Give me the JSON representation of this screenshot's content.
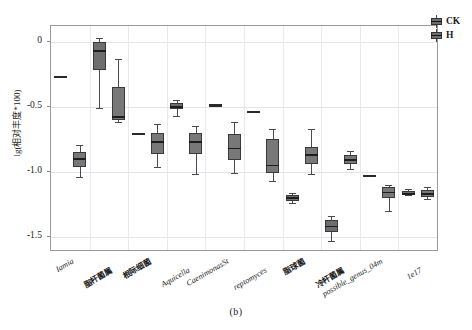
{
  "figure": {
    "caption": "(b)",
    "ylabel": "lg(相对丰度*100)"
  },
  "legend": {
    "position": "top-right",
    "items": [
      {
        "label": "CK",
        "color": "#6e6e6e",
        "key_icon": "boxplot-key-icon"
      },
      {
        "label": "H",
        "color": "#787878",
        "key_icon": "boxplot-key-icon"
      }
    ]
  },
  "yaxis": {
    "ticks": [
      "0",
      "-0.5",
      "-1.0",
      "-1.5"
    ],
    "values": [
      0,
      -0.5,
      -1.0,
      -1.5
    ],
    "min": -1.6,
    "max": 0.12
  },
  "xaxis": {
    "categories": [
      {
        "label": "Iamia",
        "style": "italic"
      },
      {
        "label": "脂杆菌属",
        "style": "cjk"
      },
      {
        "label": "根际细菌",
        "style": "cjk"
      },
      {
        "label": "Aquicella",
        "style": "italic"
      },
      {
        "label": "CaenimonasSt",
        "style": "italic"
      },
      {
        "label": "reptomyces",
        "style": "italic"
      },
      {
        "label": "脂球菌",
        "style": "cjk"
      },
      {
        "label": "冷杆菌属",
        "style": "cjk"
      },
      {
        "label": "possible_genus_04m",
        "style": "italic"
      },
      {
        "label": "1e17",
        "style": "italic"
      }
    ]
  },
  "chart_data": {
    "type": "box",
    "title": "",
    "xlabel": "",
    "ylabel": "lg(相对丰度*100)",
    "ylim": [
      -1.6,
      0.12
    ],
    "grid": true,
    "legend_position": "top-right",
    "categories": [
      "Iamia",
      "脂杆菌属",
      "根际细菌",
      "Aquicella",
      "CaenimonasSt",
      "reptomyces",
      "脂球菌",
      "冷杆菌属",
      "possible_genus_04m",
      "1e17"
    ],
    "series": [
      {
        "name": "CK",
        "color": "#6e6e6e",
        "boxes": [
          {
            "category": "Iamia",
            "min": -0.27,
            "q1": -0.27,
            "median": -0.27,
            "q3": -0.27,
            "max": -0.27,
            "degenerate": true
          },
          {
            "category": "脂杆菌属",
            "min": -0.51,
            "q1": -0.22,
            "median": -0.07,
            "q3": 0.0,
            "max": 0.03,
            "degenerate": false
          },
          {
            "category": "根际细菌",
            "min": -0.72,
            "q1": -0.72,
            "median": -0.71,
            "q3": -0.7,
            "max": -0.7,
            "degenerate": true
          },
          {
            "category": "Aquicella",
            "min": -0.57,
            "q1": -0.52,
            "median": -0.5,
            "q3": -0.47,
            "max": -0.45,
            "degenerate": false
          },
          {
            "category": "CaenimonasSt",
            "min": -0.49,
            "q1": -0.49,
            "median": -0.49,
            "q3": -0.48,
            "max": -0.48,
            "degenerate": true
          },
          {
            "category": "reptomyces",
            "min": -0.54,
            "q1": -0.54,
            "median": -0.54,
            "q3": -0.54,
            "max": -0.54,
            "degenerate": true
          },
          {
            "category": "脂球菌",
            "min": -1.24,
            "q1": -1.22,
            "median": -1.2,
            "q3": -1.18,
            "max": -1.16,
            "degenerate": false
          },
          {
            "category": "冷杆菌属",
            "min": -1.53,
            "q1": -1.46,
            "median": -1.42,
            "q3": -1.37,
            "max": -1.34,
            "degenerate": false
          },
          {
            "category": "possible_genus_04m",
            "min": -1.04,
            "q1": -1.04,
            "median": -1.03,
            "q3": -1.03,
            "max": -1.02,
            "degenerate": true
          },
          {
            "category": "1e17",
            "min": -1.18,
            "q1": -1.18,
            "median": -1.17,
            "q3": -1.15,
            "max": -1.13,
            "degenerate": false
          }
        ]
      },
      {
        "name": "H",
        "color": "#787878",
        "boxes": [
          {
            "category": "Iamia",
            "min": -1.04,
            "q1": -0.96,
            "median": -0.9,
            "q3": -0.85,
            "max": -0.79,
            "degenerate": false
          },
          {
            "category": "脂杆菌属",
            "min": -0.62,
            "q1": -0.6,
            "median": -0.58,
            "q3": -0.35,
            "max": -0.13,
            "degenerate": false
          },
          {
            "category": "根际细菌",
            "min": -0.96,
            "q1": -0.86,
            "median": -0.77,
            "q3": -0.7,
            "max": -0.63,
            "degenerate": false
          },
          {
            "category": "Aquicella",
            "min": -1.02,
            "q1": -0.86,
            "median": -0.77,
            "q3": -0.7,
            "max": -0.65,
            "degenerate": false
          },
          {
            "category": "CaenimonasSt",
            "min": -1.01,
            "q1": -0.91,
            "median": -0.82,
            "q3": -0.71,
            "max": -0.62,
            "degenerate": false
          },
          {
            "category": "reptomyces",
            "min": -1.07,
            "q1": -1.01,
            "median": -0.95,
            "q3": -0.75,
            "max": -0.67,
            "degenerate": false
          },
          {
            "category": "脂球菌",
            "min": -1.02,
            "q1": -0.94,
            "median": -0.87,
            "q3": -0.81,
            "max": -0.67,
            "degenerate": false
          },
          {
            "category": "冷杆菌属",
            "min": -0.98,
            "q1": -0.94,
            "median": -0.91,
            "q3": -0.87,
            "max": -0.84,
            "degenerate": false
          },
          {
            "category": "possible_genus_04m",
            "min": -1.3,
            "q1": -1.2,
            "median": -1.16,
            "q3": -1.12,
            "max": -1.1,
            "degenerate": false
          },
          {
            "category": "1e17",
            "min": -1.21,
            "q1": -1.19,
            "median": -1.17,
            "q3": -1.14,
            "max": -1.12,
            "degenerate": false
          }
        ]
      }
    ]
  }
}
